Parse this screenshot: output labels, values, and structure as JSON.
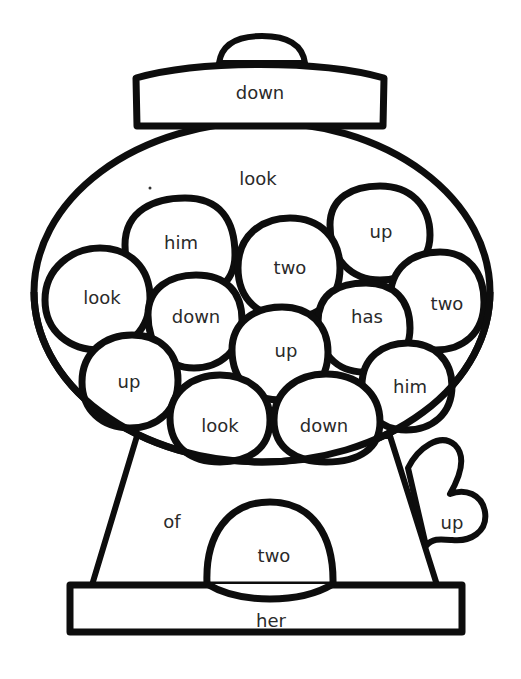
{
  "worksheet": {
    "title": "gumball machine sight word coloring page",
    "colors": {
      "outline": "#0d0d0d",
      "text": "#2a2a2a",
      "background": "#ffffff"
    },
    "lid_knob": "",
    "lid": {
      "word": "down"
    },
    "globe": {
      "word": "look"
    },
    "gumballs": [
      {
        "word": "him"
      },
      {
        "word": "up"
      },
      {
        "word": "two"
      },
      {
        "word": "look"
      },
      {
        "word": "down"
      },
      {
        "word": "has"
      },
      {
        "word": "two"
      },
      {
        "word": "up"
      },
      {
        "word": "up"
      },
      {
        "word": "him"
      },
      {
        "word": "look"
      },
      {
        "word": "down"
      }
    ],
    "base": {
      "word": "of"
    },
    "chute": {
      "word": "two"
    },
    "handle": {
      "word": "up"
    },
    "stand": {
      "word": "her"
    }
  }
}
